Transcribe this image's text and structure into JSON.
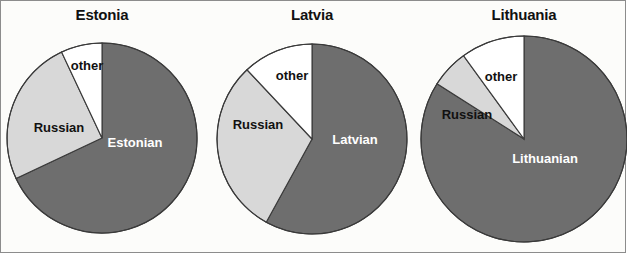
{
  "figure": {
    "background_color": "#fcfcfa",
    "border_color": "#8c8c8c"
  },
  "colors": {
    "titular": "#6e6e6e",
    "russian": "#d8d8d8",
    "other": "#ffffff",
    "outline": "#3a3a3a",
    "label_dark": "#111111",
    "label_light": "#ffffff"
  },
  "charts": [
    {
      "id": "estonia",
      "title": "Estonia",
      "center_x": 101,
      "center_y": 137,
      "radius": 95,
      "slices": [
        {
          "label": "Estonian",
          "value": 68,
          "color": "#6e6e6e",
          "label_color": "#ffffff",
          "label_x": 134,
          "label_y": 146,
          "font_size": 13
        },
        {
          "label": "Russian",
          "value": 25,
          "color": "#d8d8d8",
          "label_color": "#111111",
          "label_x": 58,
          "label_y": 131,
          "font_size": 13
        },
        {
          "label": "other",
          "value": 7,
          "color": "#ffffff",
          "label_color": "#111111",
          "label_x": 86,
          "label_y": 69,
          "font_size": 13
        }
      ]
    },
    {
      "id": "latvia",
      "title": "Latvia",
      "center_x": 311,
      "center_y": 138,
      "radius": 95,
      "slices": [
        {
          "label": "Latvian",
          "value": 58,
          "color": "#6e6e6e",
          "label_color": "#ffffff",
          "label_x": 354,
          "label_y": 143,
          "font_size": 13
        },
        {
          "label": "Russian",
          "value": 30,
          "color": "#d8d8d8",
          "label_color": "#111111",
          "label_x": 257,
          "label_y": 128,
          "font_size": 13
        },
        {
          "label": "other",
          "value": 12,
          "color": "#ffffff",
          "label_color": "#111111",
          "label_x": 291,
          "label_y": 79,
          "font_size": 13
        }
      ]
    },
    {
      "id": "lithuania",
      "title": "Lithuania",
      "center_x": 523,
      "center_y": 138,
      "radius": 103,
      "slices": [
        {
          "label": "Lithuanian",
          "value": 84,
          "color": "#6e6e6e",
          "label_color": "#ffffff",
          "label_x": 544,
          "label_y": 162,
          "font_size": 13
        },
        {
          "label": "Russian",
          "value": 6,
          "color": "#d8d8d8",
          "label_color": "#111111",
          "label_x": 466,
          "label_y": 118,
          "font_size": 13
        },
        {
          "label": "other",
          "value": 10,
          "color": "#ffffff",
          "label_color": "#111111",
          "label_x": 500,
          "label_y": 80,
          "font_size": 13
        }
      ]
    }
  ],
  "chart_data": {
    "type": "pie",
    "xlabel": "",
    "ylabel": "",
    "units": "percent of population",
    "legend": [
      "Titular language",
      "Russian",
      "other"
    ],
    "legend_position": "none (labels drawn inside slices)",
    "grid": false,
    "panels": [
      {
        "title": "Estonia",
        "labels": [
          "Estonian",
          "Russian",
          "other"
        ],
        "values": [
          68,
          25,
          7
        ],
        "colors": [
          "#6e6e6e",
          "#d8d8d8",
          "#ffffff"
        ],
        "start_angle_deg": 0,
        "direction": "clockwise"
      },
      {
        "title": "Latvia",
        "labels": [
          "Latvian",
          "Russian",
          "other"
        ],
        "values": [
          58,
          30,
          12
        ],
        "colors": [
          "#6e6e6e",
          "#d8d8d8",
          "#ffffff"
        ],
        "start_angle_deg": 0,
        "direction": "clockwise"
      },
      {
        "title": "Lithuania",
        "labels": [
          "Lithuanian",
          "Russian",
          "other"
        ],
        "values": [
          84,
          6,
          10
        ],
        "colors": [
          "#6e6e6e",
          "#d8d8d8",
          "#ffffff"
        ],
        "start_angle_deg": 0,
        "direction": "clockwise"
      }
    ]
  }
}
